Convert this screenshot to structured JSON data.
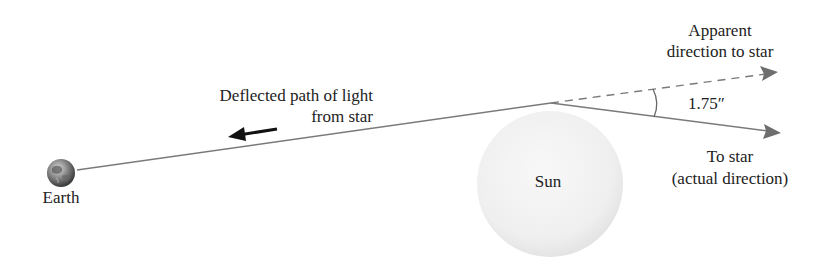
{
  "diagram": {
    "labels": {
      "earth": "Earth",
      "sun": "Sun",
      "deflected_line1": "Deflected path of light",
      "deflected_line2": "from star",
      "apparent_line1": "Apparent",
      "apparent_line2": "direction to star",
      "actual_line1": "To star",
      "actual_line2": "(actual direction)",
      "angle": "1.75″"
    },
    "icons": {
      "earth": "earth-globe-icon",
      "sun": "sun-sphere-icon",
      "arrow": "left-arrow-icon"
    },
    "colors": {
      "line": "#7a7a7a",
      "arrowhead": "#6e6e6e",
      "sun_fill": "#f1f1f1",
      "text": "#222222",
      "pointer_arrow": "#111111"
    }
  }
}
